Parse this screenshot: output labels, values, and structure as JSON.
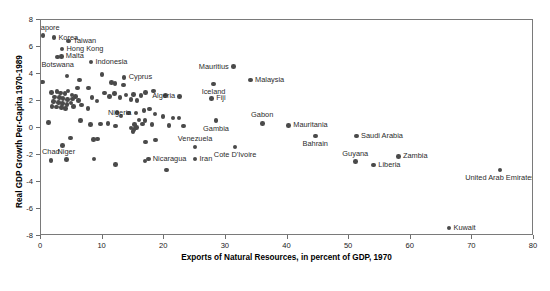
{
  "chart_data": {
    "type": "scatter",
    "title": "",
    "xlabel": "Exports of Natural Resources, in percent of GDP, 1970",
    "ylabel": "Real GDP Growth Per-Capita 1970-1989",
    "xlim": [
      0,
      80
    ],
    "ylim": [
      -8,
      8
    ],
    "xticks": [
      0,
      10,
      20,
      30,
      40,
      50,
      60,
      70,
      80
    ],
    "xticklabels": [
      "0",
      "10",
      "20",
      "30",
      "40",
      "50",
      "60",
      "70",
      "80"
    ],
    "yticks": [
      -8,
      -6,
      -4,
      -2,
      0,
      2,
      4,
      6,
      8
    ],
    "yticklabels": [
      "-8",
      "-6",
      "-4",
      "-2",
      "0",
      "2",
      "4",
      "6",
      "8"
    ],
    "grid": false,
    "legend": "none",
    "marker_color": "#4a4a4a",
    "points": [
      {
        "label": "Singapore",
        "x": 0.3,
        "y": 6.85,
        "pos": "a"
      },
      {
        "label": "Korea",
        "x": 2.1,
        "y": 6.7,
        "pos": "r"
      },
      {
        "label": "Taiwan",
        "x": 4.5,
        "y": 6.45,
        "pos": "r"
      },
      {
        "label": "Hong Kong",
        "x": 3.4,
        "y": 5.85,
        "pos": "r"
      },
      {
        "label": "Malta",
        "x": 3.3,
        "y": 5.3,
        "pos": "r"
      },
      {
        "label": "Botswana",
        "x": 2.7,
        "y": 5.25,
        "pos": "b"
      },
      {
        "label": "Indonesia",
        "x": 8.1,
        "y": 4.9,
        "pos": "r"
      },
      {
        "label": "Mauritius",
        "x": 31.2,
        "y": 4.55,
        "pos": "l"
      },
      {
        "label": "Malaysia",
        "x": 34.0,
        "y": 3.55,
        "pos": "r"
      },
      {
        "label": "Cyprus",
        "x": 13.5,
        "y": 3.75,
        "pos": "r"
      },
      {
        "label": "Iceland",
        "x": 28.0,
        "y": 3.25,
        "pos": "b"
      },
      {
        "label": "Algeria",
        "x": 22.5,
        "y": 2.35,
        "pos": "l"
      },
      {
        "label": "Fiji",
        "x": 27.7,
        "y": 2.2,
        "pos": "r"
      },
      {
        "label": "Nigeria",
        "x": 15.4,
        "y": 1.1,
        "pos": "l"
      },
      {
        "label": "Gambia",
        "x": 28.4,
        "y": 0.55,
        "pos": "b"
      },
      {
        "label": "Gabon",
        "x": 35.9,
        "y": 0.35,
        "pos": "a"
      },
      {
        "label": "Mauritania",
        "x": 40.2,
        "y": 0.2,
        "pos": "r"
      },
      {
        "label": "Bahrain",
        "x": 44.5,
        "y": -0.6,
        "pos": "b"
      },
      {
        "label": "Saudi Arabia",
        "x": 51.2,
        "y": -0.6,
        "pos": "r"
      },
      {
        "label": "Venezuela",
        "x": 25.0,
        "y": -1.4,
        "pos": "a"
      },
      {
        "label": "Cote D'Ivoire",
        "x": 31.5,
        "y": -1.4,
        "pos": "b"
      },
      {
        "label": "Zambia",
        "x": 58.0,
        "y": -2.1,
        "pos": "r"
      },
      {
        "label": "Guyana",
        "x": 51.0,
        "y": -2.5,
        "pos": "a"
      },
      {
        "label": "Liberia",
        "x": 54.0,
        "y": -2.75,
        "pos": "r"
      },
      {
        "label": "United Arab Emirates",
        "x": 74.5,
        "y": -3.1,
        "pos": "b"
      },
      {
        "label": "Kuwait",
        "x": 66.2,
        "y": -7.4,
        "pos": "r"
      },
      {
        "label": "Iran",
        "x": 25.0,
        "y": -2.3,
        "pos": "r"
      },
      {
        "label": "Nicaragua",
        "x": 17.4,
        "y": -2.3,
        "pos": "r"
      },
      {
        "label": "Chad",
        "x": 1.6,
        "y": -2.4,
        "pos": "a"
      },
      {
        "label": "Niger",
        "x": 4.1,
        "y": -2.35,
        "pos": "a"
      }
    ],
    "unlabeled_points": [
      {
        "x": 0.2,
        "y": 3.4
      },
      {
        "x": 4.2,
        "y": 3.85
      },
      {
        "x": 6.2,
        "y": 3.55
      },
      {
        "x": 9.9,
        "y": 3.95
      },
      {
        "x": 5.9,
        "y": 2.95
      },
      {
        "x": 7.7,
        "y": 2.95
      },
      {
        "x": 12.0,
        "y": 3.3
      },
      {
        "x": 13.4,
        "y": 3.2
      },
      {
        "x": 11.4,
        "y": 3.35
      },
      {
        "x": 1.7,
        "y": 2.65
      },
      {
        "x": 2.6,
        "y": 2.7
      },
      {
        "x": 3.2,
        "y": 2.6
      },
      {
        "x": 3.9,
        "y": 2.55
      },
      {
        "x": 4.4,
        "y": 2.75
      },
      {
        "x": 5.0,
        "y": 2.45
      },
      {
        "x": 2.2,
        "y": 2.3
      },
      {
        "x": 3.0,
        "y": 2.25
      },
      {
        "x": 3.6,
        "y": 2.2
      },
      {
        "x": 4.3,
        "y": 2.1
      },
      {
        "x": 5.1,
        "y": 2.15
      },
      {
        "x": 5.6,
        "y": 2.35
      },
      {
        "x": 2.0,
        "y": 1.95
      },
      {
        "x": 2.8,
        "y": 1.9
      },
      {
        "x": 3.5,
        "y": 1.8
      },
      {
        "x": 4.2,
        "y": 1.75
      },
      {
        "x": 4.9,
        "y": 1.85
      },
      {
        "x": 6.1,
        "y": 2.05
      },
      {
        "x": 1.8,
        "y": 1.6
      },
      {
        "x": 2.5,
        "y": 1.55
      },
      {
        "x": 3.3,
        "y": 1.5
      },
      {
        "x": 4.0,
        "y": 1.45
      },
      {
        "x": 5.3,
        "y": 1.6
      },
      {
        "x": 6.6,
        "y": 1.7
      },
      {
        "x": 7.6,
        "y": 1.45
      },
      {
        "x": 8.3,
        "y": 2.25
      },
      {
        "x": 9.1,
        "y": 2.0
      },
      {
        "x": 10.3,
        "y": 2.6
      },
      {
        "x": 11.1,
        "y": 2.35
      },
      {
        "x": 11.9,
        "y": 2.55
      },
      {
        "x": 12.8,
        "y": 2.25
      },
      {
        "x": 13.8,
        "y": 2.45
      },
      {
        "x": 15.0,
        "y": 2.5
      },
      {
        "x": 16.2,
        "y": 2.4
      },
      {
        "x": 17.0,
        "y": 2.65
      },
      {
        "x": 18.3,
        "y": 2.75
      },
      {
        "x": 20.2,
        "y": 2.4
      },
      {
        "x": 15.6,
        "y": 2.05
      },
      {
        "x": 14.6,
        "y": 2.1
      },
      {
        "x": 16.7,
        "y": 1.3
      },
      {
        "x": 17.6,
        "y": 1.4
      },
      {
        "x": 18.5,
        "y": 1.05
      },
      {
        "x": 19.8,
        "y": 0.85
      },
      {
        "x": 21.4,
        "y": 0.75
      },
      {
        "x": 22.4,
        "y": 0.75
      },
      {
        "x": 12.3,
        "y": 1.15
      },
      {
        "x": 13.0,
        "y": 0.9
      },
      {
        "x": 14.2,
        "y": 1.1
      },
      {
        "x": 15.9,
        "y": 0.6
      },
      {
        "x": 16.9,
        "y": 0.55
      },
      {
        "x": 18.0,
        "y": 0.25
      },
      {
        "x": 1.2,
        "y": 0.4
      },
      {
        "x": 6.4,
        "y": 0.55
      },
      {
        "x": 8.0,
        "y": 0.25
      },
      {
        "x": 9.7,
        "y": 0.3
      },
      {
        "x": 10.9,
        "y": 0.35
      },
      {
        "x": 12.1,
        "y": 0.15
      },
      {
        "x": 14.6,
        "y": 0.0
      },
      {
        "x": 15.1,
        "y": -0.1
      },
      {
        "x": 15.5,
        "y": 0.05
      },
      {
        "x": 15.2,
        "y": 0.25
      },
      {
        "x": 14.9,
        "y": -0.25
      },
      {
        "x": 16.5,
        "y": 0.3
      },
      {
        "x": 20.8,
        "y": 0.2
      },
      {
        "x": 23.1,
        "y": 0.15
      },
      {
        "x": 4.8,
        "y": -0.75
      },
      {
        "x": 8.5,
        "y": -0.85
      },
      {
        "x": 9.2,
        "y": -0.8
      },
      {
        "x": 3.5,
        "y": -1.3
      },
      {
        "x": 17.0,
        "y": -1.05
      },
      {
        "x": 18.6,
        "y": -0.9
      },
      {
        "x": 8.6,
        "y": -2.3
      },
      {
        "x": 12.1,
        "y": -2.7
      },
      {
        "x": 16.9,
        "y": -2.45
      },
      {
        "x": 20.4,
        "y": -3.1
      }
    ]
  },
  "axes": {
    "x_title": "Exports of Natural Resources, in percent of GDP, 1970",
    "y_title": "Real GDP Growth Per-Capita 1970-1989"
  }
}
